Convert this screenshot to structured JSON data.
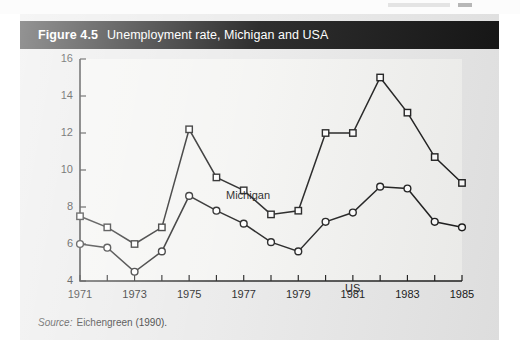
{
  "figure": {
    "number_label": "Figure 4.5",
    "title": "Unemployment rate, Michigan and USA",
    "source_label": "Source:",
    "source_text": "Eichengreen (1990)."
  },
  "colors": {
    "title_bar_bg": "#121212",
    "title_bar_text": "#ffffff",
    "figure_bg": "#e9e9e9",
    "plot_bg": "#f4f4f2",
    "ink": "#1a1a1a"
  },
  "chart_data": {
    "type": "line",
    "title": "Unemployment rate, Michigan and USA",
    "xlabel": "",
    "ylabel": "",
    "x": [
      1971,
      1972,
      1973,
      1974,
      1975,
      1976,
      1977,
      1978,
      1979,
      1980,
      1981,
      1982,
      1983,
      1984,
      1985
    ],
    "xtick_labels": [
      "1971",
      "1973",
      "1975",
      "1977",
      "1979",
      "1981",
      "1983",
      "1985"
    ],
    "xtick_values": [
      1971,
      1973,
      1975,
      1977,
      1979,
      1981,
      1983,
      1985
    ],
    "ytick_labels": [
      "4",
      "6",
      "8",
      "10",
      "12",
      "14",
      "16"
    ],
    "ytick_values": [
      4,
      6,
      8,
      10,
      12,
      14,
      16
    ],
    "xlim": [
      1971,
      1985
    ],
    "ylim": [
      4,
      16
    ],
    "grid": false,
    "legend_position": "inline-annotations",
    "series": [
      {
        "name": "Michigan",
        "marker": "square",
        "label_annotation": "Michigan",
        "values": [
          7.5,
          6.9,
          6.0,
          6.9,
          12.2,
          9.6,
          8.9,
          7.6,
          7.8,
          12.0,
          12.0,
          15.0,
          13.1,
          10.7,
          9.3
        ]
      },
      {
        "name": "US",
        "marker": "circle",
        "label_annotation": "US",
        "values": [
          6.0,
          5.8,
          4.5,
          5.6,
          8.6,
          7.8,
          7.1,
          6.1,
          5.6,
          7.2,
          7.7,
          9.1,
          9.0,
          7.2,
          6.9
        ]
      }
    ]
  }
}
